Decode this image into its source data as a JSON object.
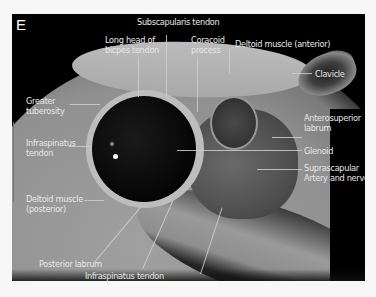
{
  "figure": {
    "panel_letter": "E",
    "scale_bar": "3cm",
    "labels": {
      "subscapularis_tendon": "Subscapularis tendon",
      "long_head_biceps_1": "Long head of",
      "long_head_biceps_2": "bicpes tendon",
      "coracoid_1": "Coracoid",
      "coracoid_2": "process",
      "deltoid_anterior": "Deltoid muscle (anterior)",
      "clavicle": "Clavicle",
      "greater_tuberosity_1": "Greater",
      "greater_tuberosity_2": "tuberosity",
      "anterosuperior_labrum_1": "Anterosuperior",
      "anterosuperior_labrum_2": "labrum",
      "infraspinatus_tendon_left_1": "Infraspinatus",
      "infraspinatus_tendon_left_2": "tendon",
      "glenoid": "Glenoid",
      "suprascapular_1": "Suprascapular",
      "suprascapular_2": "Artery and nerve",
      "deltoid_posterior_1": "Deltoid muscle",
      "deltoid_posterior_2": "(posterior)",
      "posterior_labrum": "Posterior labrum",
      "infraspinatus_tendon_bottom": "Infraspinatus tendon",
      "scapula": "Scapula"
    }
  }
}
